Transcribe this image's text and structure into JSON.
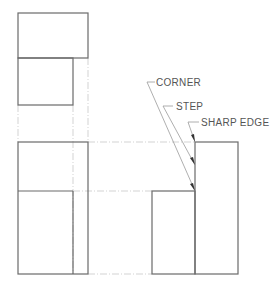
{
  "diagram": {
    "type": "orthographic-projection",
    "views": [
      "top-view",
      "front-view",
      "side-view"
    ],
    "labels": {
      "corner": "CORNER",
      "step": "STEP",
      "sharp_edge": "SHARP EDGE"
    },
    "colors": {
      "object_line": "#6a6a6a",
      "projection_line": "#c8c8c8",
      "leader_line": "#9a9a9a",
      "text": "#555555"
    }
  }
}
